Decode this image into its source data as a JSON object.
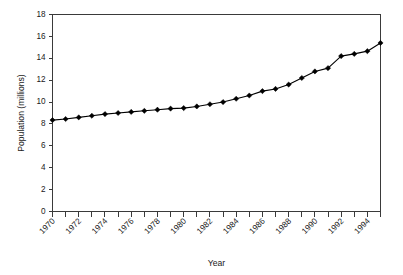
{
  "chart_data": {
    "type": "line",
    "title": "",
    "xlabel": "Year",
    "ylabel": "Population (millions)",
    "xlim": [
      1970,
      1995
    ],
    "ylim": [
      0,
      18
    ],
    "grid": false,
    "legend": "none",
    "marker": "diamond",
    "line_color": "#000000",
    "marker_color": "#000000",
    "x": [
      1970,
      1971,
      1972,
      1973,
      1974,
      1975,
      1976,
      1977,
      1978,
      1979,
      1980,
      1981,
      1982,
      1983,
      1984,
      1985,
      1986,
      1987,
      1988,
      1989,
      1990,
      1991,
      1992,
      1993,
      1994,
      1995
    ],
    "values": [
      8.35,
      8.45,
      8.6,
      8.75,
      8.9,
      9.0,
      9.1,
      9.2,
      9.3,
      9.4,
      9.45,
      9.6,
      9.8,
      10.0,
      10.3,
      10.6,
      11.0,
      11.2,
      11.6,
      12.2,
      12.8,
      13.1,
      14.2,
      14.4,
      14.65,
      15.4
    ],
    "xticks": [
      1970,
      1972,
      1974,
      1976,
      1978,
      1980,
      1982,
      1984,
      1986,
      1988,
      1990,
      1992,
      1994
    ],
    "xtick_labels": [
      "1970",
      "1972",
      "1974",
      "1976",
      "1978",
      "1980",
      "1982",
      "1984",
      "1986",
      "1988",
      "1990",
      "1992",
      "1994"
    ],
    "xtick_minor": [
      1971,
      1973,
      1975,
      1977,
      1979,
      1981,
      1983,
      1985,
      1987,
      1989,
      1991,
      1993,
      1995
    ],
    "yticks": [
      0,
      2,
      4,
      6,
      8,
      10,
      12,
      14,
      16,
      18
    ],
    "ytick_labels": [
      "0",
      "2",
      "4",
      "6",
      "8",
      "10",
      "12",
      "14",
      "16",
      "18"
    ],
    "xtick_label_rotation": -45
  }
}
